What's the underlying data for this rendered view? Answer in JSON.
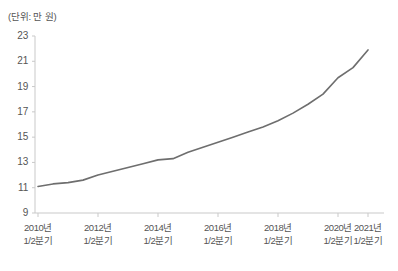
{
  "unit_note": "(단위: 만 원)",
  "axis": {
    "y_ticks": [
      "23",
      "21",
      "19",
      "17",
      "15",
      "13",
      "11",
      "9"
    ],
    "x_ticks": [
      {
        "year": "2010년",
        "quarter": "1/2분기"
      },
      {
        "year": "2012년",
        "quarter": "1/2분기"
      },
      {
        "year": "2014년",
        "quarter": "1/2분기"
      },
      {
        "year": "2016년",
        "quarter": "1/2분기"
      },
      {
        "year": "2018년",
        "quarter": "1/2분기"
      },
      {
        "year": "2020년",
        "quarter": "1/2분기"
      },
      {
        "year": "2021년",
        "quarter": "1/2분기"
      }
    ]
  },
  "colors": {
    "line": "#6e6e6e",
    "axis": "#c9c9c9",
    "text": "#555555",
    "background": "#ffffff"
  },
  "chart_data": {
    "type": "line",
    "title": "",
    "subtitle": "",
    "xlabel": "",
    "ylabel": "(단위: 만 원)",
    "grid": false,
    "legend": "none",
    "ylim": [
      9,
      23
    ],
    "ytick_values": [
      9,
      11,
      13,
      15,
      17,
      19,
      21,
      23
    ],
    "xtick_labels": [
      "2010년 1/2분기",
      "2012년 1/2분기",
      "2014년 1/2분기",
      "2016년 1/2분기",
      "2018년 1/2분기",
      "2020년 1/2분기",
      "2021년 1/2분기"
    ],
    "x": [
      "2010 1/2분기",
      "2010 2/2분기",
      "2011 1/2분기",
      "2011 2/2분기",
      "2012 1/2분기",
      "2012 2/2분기",
      "2013 1/2분기",
      "2013 2/2분기",
      "2014 1/2분기",
      "2014 2/2분기",
      "2015 1/2분기",
      "2015 2/2분기",
      "2016 1/2분기",
      "2016 2/2분기",
      "2017 1/2분기",
      "2017 2/2분기",
      "2018 1/2분기",
      "2018 2/2분기",
      "2019 1/2분기",
      "2019 2/2분기",
      "2020 1/2분기",
      "2020 2/2분기",
      "2021 1/2분기"
    ],
    "series": [
      {
        "name": "평균값",
        "values": [
          11.1,
          11.3,
          11.4,
          11.6,
          12.0,
          12.3,
          12.6,
          12.9,
          13.2,
          13.3,
          13.8,
          14.2,
          14.6,
          15.0,
          15.4,
          15.8,
          16.3,
          16.9,
          17.6,
          18.4,
          19.7,
          20.5,
          21.9
        ]
      }
    ]
  }
}
